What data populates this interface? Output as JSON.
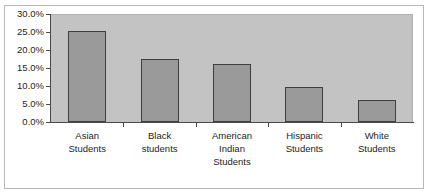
{
  "chart_data": {
    "type": "bar",
    "title": "",
    "subtitle": "",
    "xlabel": "",
    "ylabel": "",
    "categories": [
      "Asian Students",
      "Black students",
      "American Indian Students",
      "Hispanic Students",
      "White Students"
    ],
    "category_lines": [
      [
        "Asian",
        "Students"
      ],
      [
        "Black",
        "students"
      ],
      [
        "American",
        "Indian",
        "Students"
      ],
      [
        "Hispanic",
        "Students"
      ],
      [
        "White",
        "Students"
      ]
    ],
    "values": [
      25.2,
      17.6,
      16.0,
      9.8,
      6.2
    ],
    "value_labels": [
      "25.2%",
      "17.6%",
      "16.0%",
      "9.8%",
      "6.2%"
    ],
    "ylim": [
      0,
      30
    ],
    "ytick_values": [
      0,
      5,
      10,
      15,
      20,
      25,
      30
    ],
    "ytick_labels": [
      "0.0%",
      "5.0%",
      "10.0%",
      "15.0%",
      "20.0%",
      "25.0%",
      "30.0%"
    ],
    "grid": false,
    "legend": null,
    "legend_position": "none",
    "colors": {
      "bar_fill": "#9a9a9a",
      "bar_border": "#3f3f3f",
      "plot_background": "#c3c3c3",
      "figure_background": "#ffffff",
      "axis_line": "#4a4a4a",
      "frame_border": "#b9b9b9",
      "text": "#1d1d1d"
    }
  }
}
